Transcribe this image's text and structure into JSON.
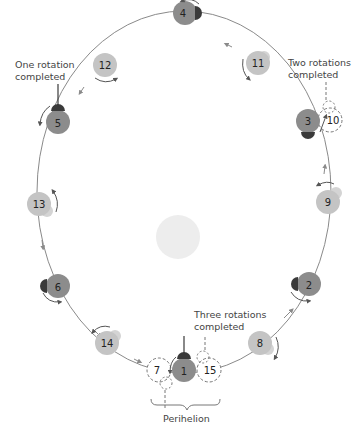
{
  "diagram": {
    "title": "",
    "colors": {
      "orbit": "#8a8a8a",
      "dark_planet": "#8c8c8c",
      "light_planet": "#c4c4c4",
      "marker": "#3a3a3a",
      "sun": "#ededed",
      "dashed": "#777777",
      "text": "#444444"
    },
    "sun": {
      "label": ""
    },
    "positions": [
      {
        "n": "1",
        "type": "dark"
      },
      {
        "n": "2",
        "type": "dark"
      },
      {
        "n": "3",
        "type": "dark"
      },
      {
        "n": "4",
        "type": "dark"
      },
      {
        "n": "5",
        "type": "dark"
      },
      {
        "n": "6",
        "type": "dark"
      },
      {
        "n": "7",
        "type": "dashed"
      },
      {
        "n": "8",
        "type": "light"
      },
      {
        "n": "9",
        "type": "light"
      },
      {
        "n": "10",
        "type": "dashed"
      },
      {
        "n": "11",
        "type": "light"
      },
      {
        "n": "12",
        "type": "light"
      },
      {
        "n": "13",
        "type": "light"
      },
      {
        "n": "14",
        "type": "light"
      },
      {
        "n": "15",
        "type": "dashed"
      }
    ],
    "annotations": {
      "one_rotation": [
        "One rotation",
        "completed"
      ],
      "two_rotations": [
        "Two rotations",
        "completed"
      ],
      "three_rotations": [
        "Three rotations",
        "completed"
      ],
      "perihelion": "Perihelion"
    }
  }
}
